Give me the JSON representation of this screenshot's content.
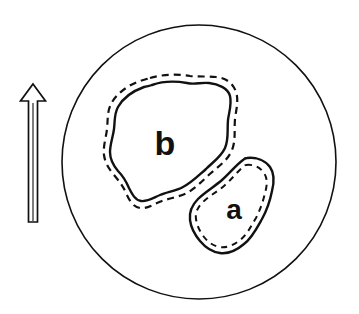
{
  "figure": {
    "name": "circular-field-of-view-diagram",
    "type": "line-diagram",
    "background_color": "#ffffff",
    "stroke_color": "#111111",
    "width": 359,
    "height": 314
  },
  "field_of_view": {
    "label": "circular field of view boundary",
    "shape": "circle",
    "center_x": 199,
    "center_y": 162,
    "radius": 137,
    "stroke_width": 1.6,
    "fill": "none"
  },
  "north_arrow": {
    "label": "north orientation arrow",
    "direction": "up",
    "style": "hollow outlined arrow",
    "shaft_top_y": 100,
    "shaft_bottom_y": 222,
    "shaft_x": 33,
    "head_tip_y": 84,
    "stroke_width": 1.6,
    "fill": "none"
  },
  "regions": [
    {
      "id": "b",
      "label": "b",
      "label_x": 172,
      "label_y": 152,
      "label_font_size": 30,
      "outer_outline": "dashed",
      "inner_outline": "solid",
      "description": "large irregular blob, upper-left of center"
    },
    {
      "id": "a",
      "label": "a",
      "label_x": 236,
      "label_y": 216,
      "label_font_size": 26,
      "outer_outline": "solid",
      "inner_outline": "dashed",
      "description": "smaller elongated irregular blob, lower-right of center"
    }
  ],
  "colors": {
    "ink": "#111111",
    "paper": "#ffffff"
  }
}
